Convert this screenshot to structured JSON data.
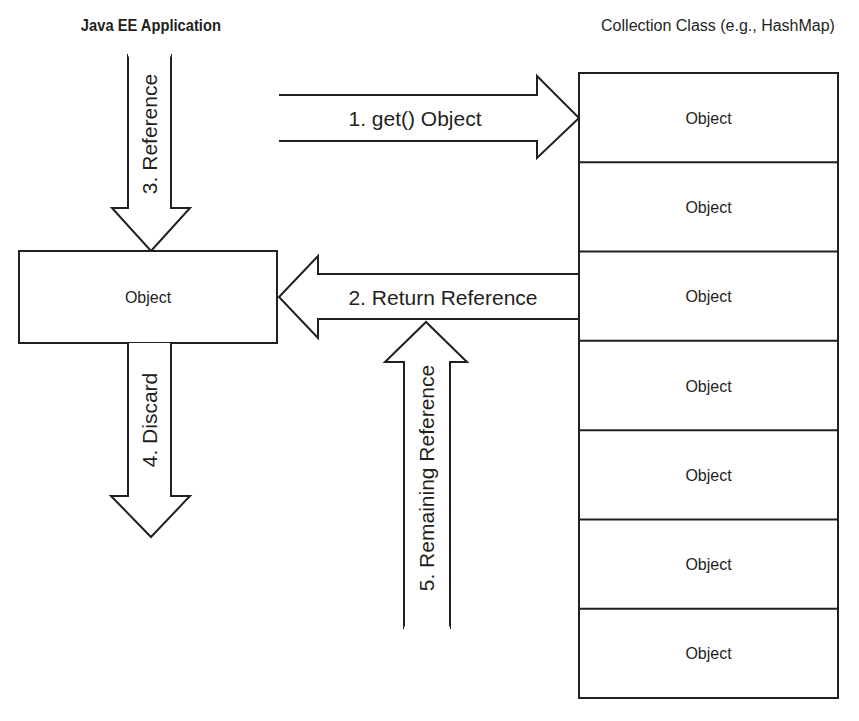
{
  "titles": {
    "left": "Java EE Application",
    "right": "Collection Class (e.g., HashMap)"
  },
  "client_object": {
    "label": "Object"
  },
  "collection": {
    "cells": [
      {
        "label": "Object"
      },
      {
        "label": "Object"
      },
      {
        "label": "Object"
      },
      {
        "label": "Object"
      },
      {
        "label": "Object"
      },
      {
        "label": "Object"
      },
      {
        "label": "Object"
      }
    ]
  },
  "arrows": {
    "get": {
      "label": "1. get() Object",
      "direction": "right"
    },
    "return": {
      "label": "2. Return Reference",
      "direction": "left"
    },
    "reference": {
      "label": "3. Reference",
      "direction": "down"
    },
    "discard": {
      "label": "4. Discard",
      "direction": "down"
    },
    "remaining": {
      "label": "5. Remaining Reference",
      "direction": "up"
    }
  },
  "colors": {
    "stroke": "#231f20",
    "fill": "#ffffff",
    "background": "#ffffff"
  }
}
